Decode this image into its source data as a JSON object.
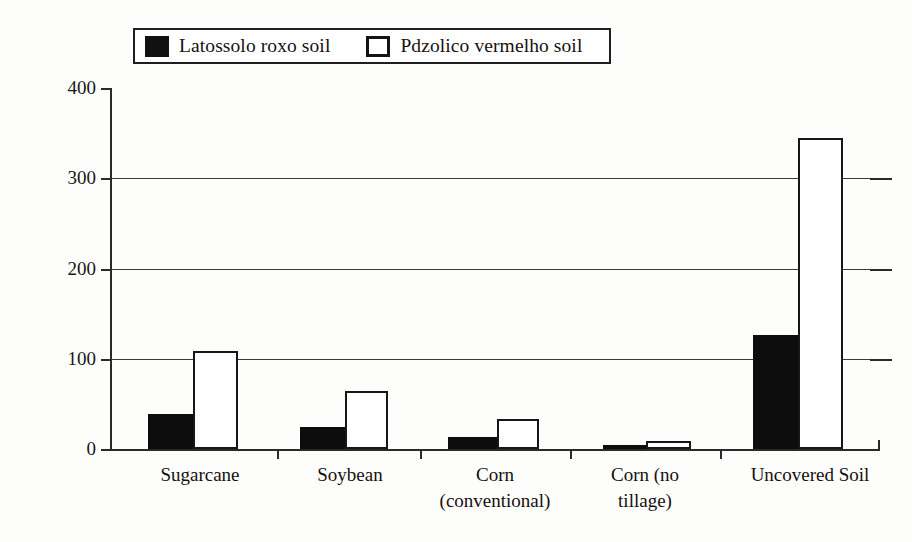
{
  "figure": {
    "background_color": "#fdfdfc",
    "ink_color": "#111111"
  },
  "legend": {
    "position": "top-left",
    "entries": [
      {
        "label": "Latossolo roxo soil",
        "swatch": "filled-black-square",
        "color": "#111111"
      },
      {
        "label": "Pdzolico vermelho soil",
        "swatch": "hollow-white-square",
        "color": "#ffffff"
      }
    ]
  },
  "axes": {
    "ylabel": "Annual Soil Loss (tonne/ha)",
    "xlabel": "",
    "yticks": [
      "0",
      "100",
      "200",
      "300",
      "400"
    ],
    "ytick_values": [
      0,
      100,
      200,
      300,
      400
    ]
  },
  "chart_data": {
    "type": "bar",
    "title": "",
    "xlabel": "",
    "ylabel": "Annual Soil Loss (tonne/ha)",
    "ylim": [
      0,
      400
    ],
    "ytick_step": 100,
    "grid": true,
    "legend_position": "top-left",
    "categories": [
      "Sugarcane",
      "Corn (conventional)",
      "Corn (no tillage)",
      "Soybean",
      "Uncovered Soil"
    ],
    "category_lines": [
      [
        "Sugarcane"
      ],
      [
        "Soybean"
      ],
      [
        "Corn",
        "(conventional)"
      ],
      [
        "Corn (no",
        "tillage)"
      ],
      [
        "Uncovered Soil"
      ]
    ],
    "categories_ordered": [
      "Sugarcane",
      "Soybean",
      "Corn (conventional)",
      "Corn (no tillage)",
      "Uncovered Soil"
    ],
    "series": [
      {
        "name": "Latossolo roxo soil",
        "color": "#111111",
        "values": [
          39,
          24,
          13,
          4,
          126
        ]
      },
      {
        "name": "Pdzolico vermelho soil",
        "color": "#ffffff",
        "values": [
          109,
          64,
          33,
          9,
          345
        ]
      }
    ]
  },
  "bars": [
    {
      "group": "Sugarcane",
      "series": "Latossolo roxo soil",
      "value": 39,
      "style": "dark",
      "left": 38,
      "width": 45
    },
    {
      "group": "Sugarcane",
      "series": "Pdzolico vermelho soil",
      "value": 109,
      "style": "light",
      "left": 83,
      "width": 45
    },
    {
      "group": "Soybean",
      "series": "Latossolo roxo soil",
      "value": 24,
      "style": "dark",
      "left": 190,
      "width": 45
    },
    {
      "group": "Soybean",
      "series": "Pdzolico vermelho soil",
      "value": 64,
      "style": "light",
      "left": 235,
      "width": 43
    },
    {
      "group": "Corn (conventional)",
      "series": "Latossolo roxo soil",
      "value": 13,
      "style": "dark",
      "left": 338,
      "width": 49
    },
    {
      "group": "Corn (conventional)",
      "series": "Pdzolico vermelho soil",
      "value": 33,
      "style": "light",
      "left": 387,
      "width": 42
    },
    {
      "group": "Corn (no tillage)",
      "series": "Latossolo roxo soil",
      "value": 4,
      "style": "dark",
      "left": 493,
      "width": 43
    },
    {
      "group": "Corn (no tillage)",
      "series": "Pdzolico vermelho soil",
      "value": 9,
      "style": "light",
      "left": 536,
      "width": 45
    },
    {
      "group": "Uncovered Soil",
      "series": "Latossolo roxo soil",
      "value": 126,
      "style": "dark",
      "left": 643,
      "width": 45
    },
    {
      "group": "Uncovered Soil",
      "series": "Pdzolico vermelho soil",
      "value": 345,
      "style": "light",
      "left": 688,
      "width": 45
    }
  ],
  "group_tick_positions": [
    167,
    310,
    460,
    610,
    768
  ],
  "category_label_positions": [
    {
      "left": 0,
      "width": 180
    },
    {
      "left": 155,
      "width": 170
    },
    {
      "left": 290,
      "width": 190
    },
    {
      "left": 445,
      "width": 180
    },
    {
      "left": 600,
      "width": 200
    }
  ]
}
